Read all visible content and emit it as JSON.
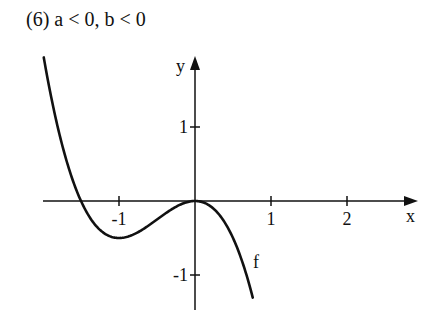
{
  "title": "(6) a < 0, b < 0",
  "chart_data": {
    "type": "line",
    "title": "(6) a < 0, b < 0",
    "function": "f(x) = a·x³ + b·x²  (approx. a = -1, b = -1.5)",
    "xlabel": "x",
    "ylabel": "y",
    "curve_label": "f",
    "xlim": [
      -2.0,
      2.9
    ],
    "ylim": [
      -1.5,
      2.0
    ],
    "x_ticks": [
      -1,
      1,
      2
    ],
    "x_tick_labels": [
      "-1",
      "1",
      "2"
    ],
    "y_ticks": [
      1,
      -1
    ],
    "y_tick_labels": [
      "1",
      "-1"
    ],
    "grid": false,
    "legend": "none",
    "series": [
      {
        "name": "f",
        "x": [
          -1.99,
          -1.75,
          -1.5,
          -1.25,
          -1.0,
          -0.75,
          -0.5,
          -0.25,
          0.0,
          0.25,
          0.5,
          0.76
        ],
        "values": [
          1.94,
          0.77,
          0.0,
          -0.39,
          -0.5,
          -0.42,
          -0.25,
          -0.08,
          0.0,
          -0.11,
          -0.5,
          -1.31
        ]
      }
    ],
    "annotations": [
      "local maximum at (0, 0)",
      "local minimum at (-1, -0.5)",
      "root at x = -1.5"
    ]
  },
  "axes": {
    "origin_px": [
      195,
      201
    ],
    "x_unit_px": 76,
    "y_unit_px": 74
  }
}
